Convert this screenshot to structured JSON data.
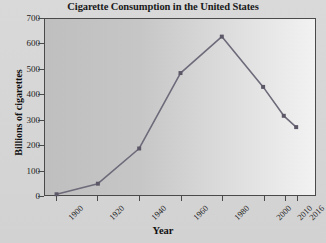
{
  "chart_data": {
    "type": "line",
    "title": "Cigarette Consumption in the United States",
    "xlabel": "Year",
    "ylabel": "Billions of cigarettes",
    "categories": [
      "1900",
      "1920",
      "1940",
      "1960",
      "1980",
      "2000",
      "2010",
      "2016"
    ],
    "values": [
      3,
      45,
      185,
      485,
      630,
      430,
      315,
      270
    ],
    "x": [
      1900,
      1920,
      1940,
      1960,
      1980,
      2000,
      2010,
      2016
    ],
    "ylim": [
      0,
      700
    ],
    "yticks": [
      0,
      100,
      200,
      300,
      400,
      500,
      600,
      700
    ],
    "ytick_labels": [
      "0",
      "100",
      "200",
      "300",
      "400",
      "500",
      "600",
      "700"
    ],
    "xtick_labels": [
      "1900",
      "1920",
      "1940",
      "1960",
      "1980",
      "2000",
      "2010",
      "2016"
    ],
    "grid": false,
    "legend": false,
    "series": [
      {
        "name": "Cigarette consumption",
        "values": [
          3,
          45,
          185,
          485,
          630,
          430,
          315,
          270
        ]
      }
    ],
    "line_color": "#6e6a7a",
    "marker": "square",
    "marker_color": "#5d5868",
    "plot_background_left": "#bfbfbf",
    "plot_background_right": "#f2f2f2",
    "figure_background": "#d6d6d6",
    "axis_color": "#4a4a4a"
  }
}
